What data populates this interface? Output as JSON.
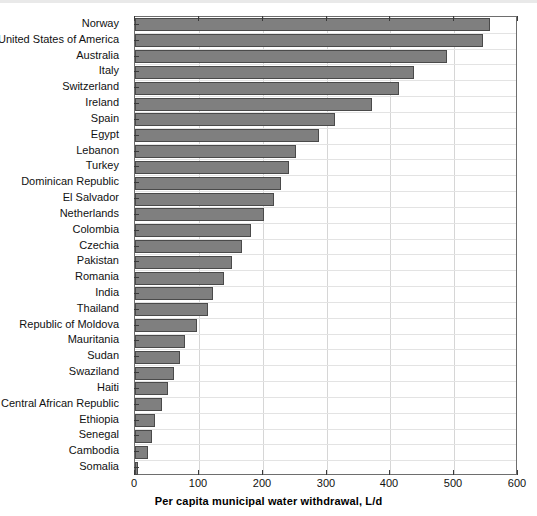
{
  "chart_data": {
    "type": "bar",
    "orientation": "horizontal",
    "title": "",
    "xlabel": "Per capita municipal water withdrawal, L/d",
    "ylabel": "",
    "xlim": [
      0,
      600
    ],
    "xticks": [
      0,
      100,
      200,
      300,
      400,
      500,
      600
    ],
    "grid": true,
    "grid_axis": "both",
    "legend": null,
    "bar_color": "#7f7f7f",
    "bar_edge_color": "#4a4a4a",
    "categories": [
      "Norway",
      "United States of America",
      "Australia",
      "Italy",
      "Switzerland",
      "Ireland",
      "Spain",
      "Egypt",
      "Lebanon",
      "Turkey",
      "Dominican Republic",
      "El Salvador",
      "Netherlands",
      "Colombia",
      "Czechia",
      "Pakistan",
      "Romania",
      "India",
      "Thailand",
      "Republic of Moldova",
      "Mauritania",
      "Sudan",
      "Swaziland",
      "Haiti",
      "Central African Republic",
      "Ethiopia",
      "Senegal",
      "Cambodia",
      "Somalia"
    ],
    "values": [
      556,
      545,
      489,
      437,
      413,
      372,
      313,
      289,
      252,
      241,
      229,
      218,
      202,
      182,
      167,
      152,
      140,
      122,
      115,
      97,
      79,
      70,
      61,
      51,
      42,
      31,
      27,
      21,
      5
    ]
  },
  "axis": {
    "x_tick_labels": [
      "0",
      "100",
      "200",
      "300",
      "400",
      "500",
      "600"
    ],
    "x_title": "Per capita municipal water withdrawal, L/d"
  }
}
